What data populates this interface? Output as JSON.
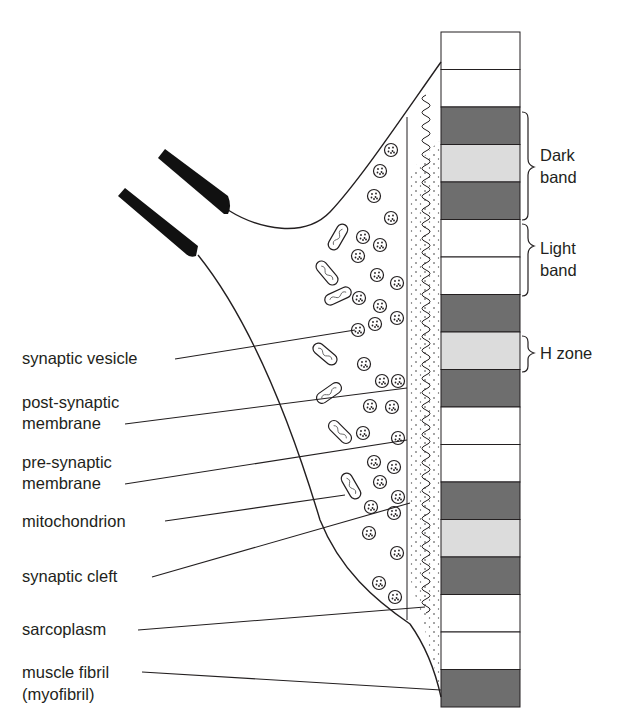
{
  "figure": {
    "colors": {
      "line": "#231f20",
      "dark_band": "#6e6e6e",
      "light_band": "#dcdcdc",
      "white_band": "#ffffff",
      "axon_sheath": "#111111"
    }
  },
  "labels": {
    "synaptic_vesicle": "synaptic vesicle",
    "post_synaptic_1": "post-synaptic",
    "post_synaptic_2": "membrane",
    "pre_synaptic_1": "pre-synaptic",
    "pre_synaptic_2": "membrane",
    "mitochondrion": "mitochondrion",
    "synaptic_cleft": "synaptic cleft",
    "sarcoplasm": "sarcoplasm",
    "muscle_fibril_1": "muscle fibril",
    "muscle_fibril_2": "(myofibril)"
  },
  "band_labels": {
    "dark_band_1": "Dark",
    "dark_band_2": "band",
    "light_band_1": "Light",
    "light_band_2": "band",
    "h_zone": "H zone"
  },
  "myofibril_bands": [
    "white",
    "white",
    "dark",
    "light",
    "dark",
    "white",
    "white",
    "dark",
    "light",
    "dark",
    "white",
    "white",
    "dark",
    "light",
    "dark",
    "white",
    "white",
    "dark"
  ]
}
